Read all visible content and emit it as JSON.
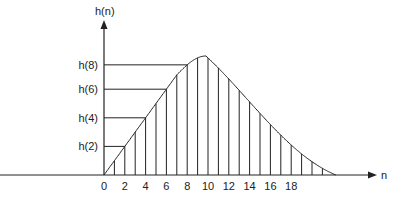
{
  "diagram": {
    "y_axis_label": "h(n)",
    "x_axis_label": "n",
    "x_tick_labels": [
      "0",
      "2",
      "4",
      "6",
      "8",
      "10",
      "12",
      "14",
      "16",
      "18"
    ],
    "x_tick_values": [
      0,
      2,
      4,
      6,
      8,
      10,
      12,
      14,
      16,
      18
    ],
    "y_markers": [
      {
        "label": "h(2)",
        "n": 2
      },
      {
        "label": "h(4)",
        "n": 4
      },
      {
        "label": "h(6)",
        "n": 6
      },
      {
        "label": "h(8)",
        "n": 8
      }
    ],
    "sample_n": [
      1,
      2,
      3,
      4,
      5,
      6,
      7,
      8,
      9,
      10,
      11,
      12,
      13,
      14,
      15,
      16,
      17,
      18,
      19,
      20,
      21
    ],
    "curve": {
      "description": "impulse response envelope: linear rise from n=0, peak near n=10, smooth decay to zero near n=22",
      "start_n": 0,
      "peak_n": 9.8,
      "end_n": 22.3
    },
    "colors": {
      "line": "#222222",
      "background": "#ffffff"
    }
  }
}
